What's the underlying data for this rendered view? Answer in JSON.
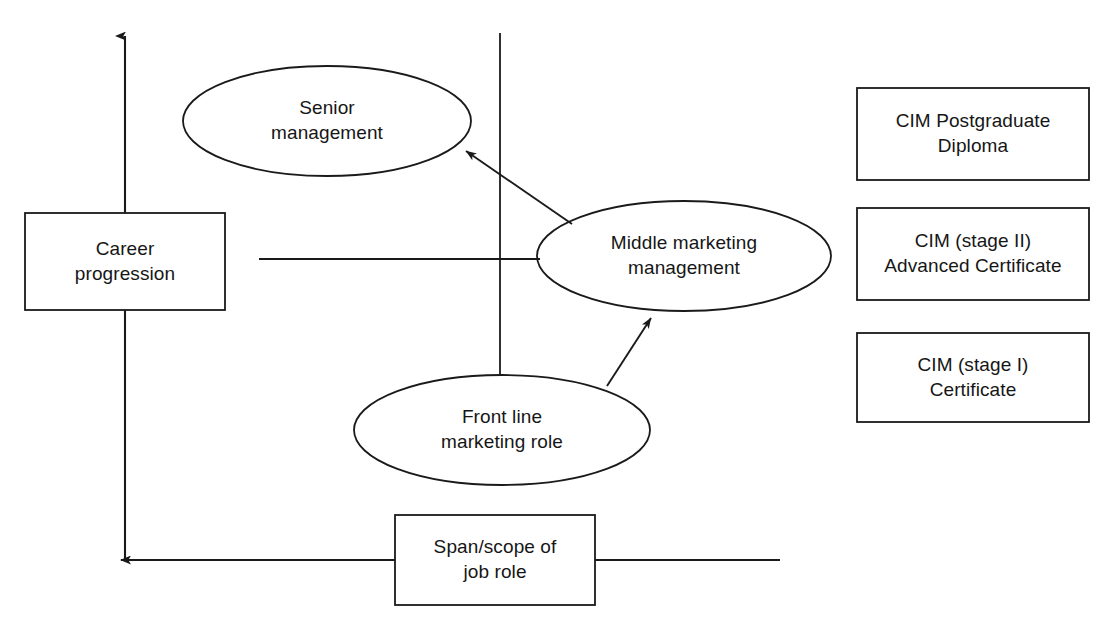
{
  "diagram": {
    "axes": {
      "y_axis": {
        "label": "Career progression",
        "direction": "up",
        "arrow": "arrow-up"
      },
      "x_axis": {
        "label": "Span/scope of job role",
        "direction": "left",
        "arrow": "arrow-left"
      }
    },
    "roles": [
      {
        "id": "senior-management",
        "label": "Senior\nmanagement",
        "shape": "ellipse"
      },
      {
        "id": "middle-marketing-management",
        "label": "Middle marketing\nmanagement",
        "shape": "ellipse"
      },
      {
        "id": "front-line-marketing-role",
        "label": "Front line\nmarketing role",
        "shape": "ellipse"
      }
    ],
    "axis_boxes": [
      {
        "id": "career-progression",
        "label": "Career\nprogression",
        "shape": "rect"
      },
      {
        "id": "span-scope-of-job-role",
        "label": "Span/scope of\njob role",
        "shape": "rect"
      }
    ],
    "qualifications": [
      {
        "id": "cim-postgraduate-diploma",
        "label": "CIM Postgraduate\nDiploma"
      },
      {
        "id": "cim-stage-ii-advanced-certificate",
        "label": "CIM (stage II)\nAdvanced Certificate"
      },
      {
        "id": "cim-stage-i-certificate",
        "label": "CIM (stage I)\nCertificate"
      }
    ],
    "connections": [
      {
        "id": "front-line-to-middle",
        "from": "front-line-marketing-role",
        "to": "middle-marketing-management",
        "style": "arrow"
      },
      {
        "id": "middle-to-senior",
        "from": "middle-marketing-management",
        "to": "senior-management",
        "style": "arrow"
      },
      {
        "id": "middle-horizontal-connector",
        "from": "middle-marketing-management",
        "to": "career-progression-axis",
        "style": "line"
      },
      {
        "id": "front-line-vertical-connector",
        "from": "front-line-marketing-role",
        "to": "upper-vertical-guide",
        "style": "line"
      }
    ],
    "colors": {
      "stroke": "#1a1a1a",
      "background": "#ffffff",
      "text": "#161616"
    }
  }
}
